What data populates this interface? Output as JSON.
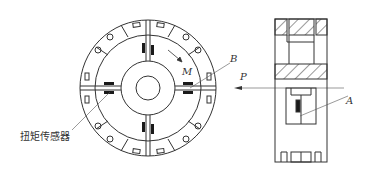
{
  "diagram": {
    "labels": {
      "torque_sensor": "扭矩传感器",
      "M": "M",
      "B": "B",
      "P": "P",
      "A": "A"
    },
    "colors": {
      "line": "#333333",
      "sensor": "#1a1a1a",
      "background": "#ffffff"
    }
  }
}
